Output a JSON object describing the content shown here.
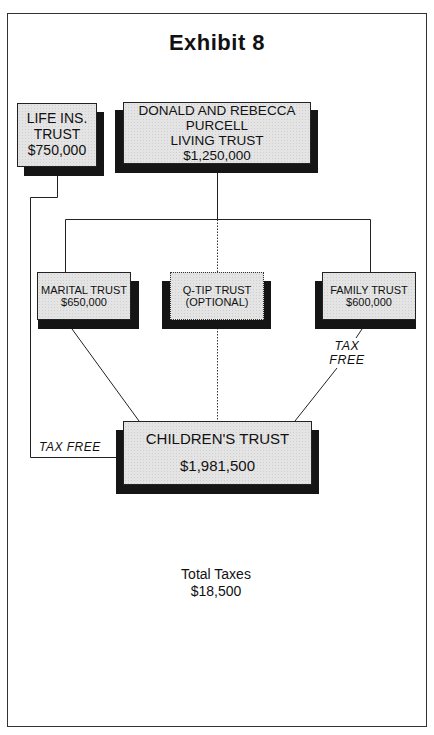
{
  "page": {
    "running_header_fragment": "... copy ... ... ... ..."
  },
  "exhibit": {
    "title": "Exhibit 8"
  },
  "nodes": {
    "life_insurance_trust": {
      "lines": [
        "LIFE INS.",
        "TRUST",
        "$750,000"
      ],
      "amount": "$750,000"
    },
    "living_trust": {
      "lines": [
        "DONALD AND REBECCA",
        "PURCELL",
        "LIVING TRUST",
        "$1,250,000"
      ],
      "amount": "$1,250,000"
    },
    "marital_trust": {
      "lines": [
        "MARITAL TRUST",
        "$650,000"
      ],
      "amount": "$650,000"
    },
    "qtip_trust": {
      "lines": [
        "Q-TIP TRUST",
        "(OPTIONAL)"
      ],
      "optional": true
    },
    "family_trust": {
      "lines": [
        "FAMILY TRUST",
        "$600,000"
      ],
      "amount": "$600,000"
    },
    "childrens_trust": {
      "lines": [
        "CHILDREN'S TRUST",
        "$1,981,500"
      ],
      "amount": "$1,981,500"
    }
  },
  "edges": [
    {
      "from": "living_trust",
      "to": "marital_trust",
      "style": "solid"
    },
    {
      "from": "living_trust",
      "to": "qtip_trust",
      "style": "dotted"
    },
    {
      "from": "living_trust",
      "to": "family_trust",
      "style": "solid"
    },
    {
      "from": "marital_trust",
      "to": "childrens_trust",
      "style": "solid"
    },
    {
      "from": "qtip_trust",
      "to": "childrens_trust",
      "style": "dotted"
    },
    {
      "from": "family_trust",
      "to": "childrens_trust",
      "style": "solid",
      "label": "TAX FREE"
    },
    {
      "from": "life_insurance_trust",
      "to": "childrens_trust",
      "style": "solid",
      "label": "TAX FREE"
    }
  ],
  "edge_labels": {
    "family_tax_free_line1": "TAX",
    "family_tax_free_line2": "FREE",
    "life_ins_tax_free": "TAX FREE"
  },
  "summary": {
    "total_taxes_label": "Total Taxes",
    "total_taxes_value": "$18,500"
  },
  "colors": {
    "box_fill": "#e4e4e4",
    "shadow": "#151515",
    "line": "#222222"
  }
}
